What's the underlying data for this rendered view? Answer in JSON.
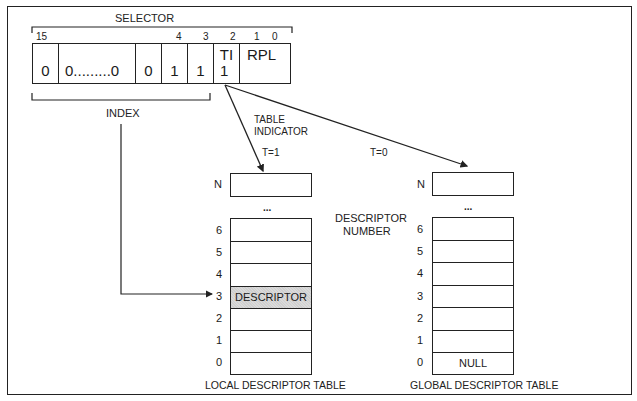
{
  "selector": {
    "title": "SELECTOR",
    "bit_labels": {
      "b15": "15",
      "b4": "4",
      "b3": "3",
      "b2": "2",
      "b1": "1",
      "b0": "0"
    },
    "fields": [
      {
        "name": "bit15",
        "value": "0"
      },
      {
        "name": "middle",
        "value": "0.........0"
      },
      {
        "name": "bit5",
        "value": "0"
      },
      {
        "name": "bit4",
        "value": "1"
      },
      {
        "name": "bit3",
        "value": "1"
      },
      {
        "name": "ti",
        "label": "TI",
        "value": "1"
      },
      {
        "name": "rpl",
        "label": "RPL",
        "value": ""
      }
    ],
    "index_label": "INDEX"
  },
  "annotations": {
    "table_indicator": [
      "TABLE",
      "INDICATOR"
    ],
    "t1": "T=1",
    "t0": "T=0",
    "descriptor_number": [
      "DESCRIPTOR",
      "NUMBER"
    ],
    "ellipsis": "..."
  },
  "ldt": {
    "title": "LOCAL DESCRIPTOR TABLE",
    "top_label": "N",
    "rows": [
      {
        "num": "6",
        "text": ""
      },
      {
        "num": "5",
        "text": ""
      },
      {
        "num": "4",
        "text": ""
      },
      {
        "num": "3",
        "text": "DESCRIPTOR",
        "highlighted": true
      },
      {
        "num": "2",
        "text": ""
      },
      {
        "num": "1",
        "text": ""
      },
      {
        "num": "0",
        "text": ""
      }
    ]
  },
  "gdt": {
    "title": "GLOBAL DESCRIPTOR TABLE",
    "top_label": "N",
    "rows": [
      {
        "num": "6",
        "text": ""
      },
      {
        "num": "5",
        "text": ""
      },
      {
        "num": "4",
        "text": ""
      },
      {
        "num": "3",
        "text": ""
      },
      {
        "num": "2",
        "text": ""
      },
      {
        "num": "1",
        "text": ""
      },
      {
        "num": "0",
        "text": "NULL"
      }
    ]
  },
  "colors": {
    "line": "#222222",
    "highlight": "#d4d4d4",
    "background": "#ffffff"
  }
}
